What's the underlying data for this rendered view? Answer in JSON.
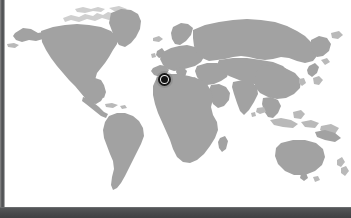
{
  "window": {
    "title": "",
    "chrome": {
      "left_rail_color": "#4e5052",
      "bottom_bar_color": "#4c4e50"
    }
  },
  "map": {
    "name": "world-map",
    "projection": "equirectangular",
    "background_color": "#ffffff",
    "land_color": "#a2a2a2",
    "ocean_color": "#ffffff",
    "width_px": 346,
    "height_px": 205,
    "continents": [
      "North America",
      "South America",
      "Greenland",
      "Europe",
      "Africa",
      "Asia",
      "Australia",
      "New Zealand",
      "Japan",
      "Southeast Asia",
      "Madagascar",
      "British Isles",
      "Iceland"
    ],
    "markers": [
      {
        "name": "selected-location",
        "label": "",
        "region": "Strait of Gibraltar / Iberian Peninsula",
        "x_px": 159,
        "y_px": 79,
        "ring_color": "#1a1a1a",
        "dot_color": "#141414",
        "halo_color": "#787878"
      }
    ],
    "grid": false,
    "legend": false,
    "labels": []
  }
}
